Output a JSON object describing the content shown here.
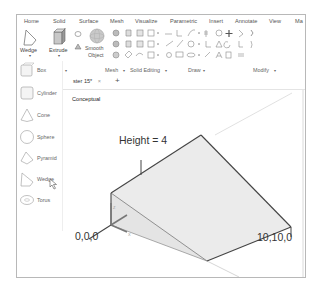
{
  "ribbon": {
    "tabs": [
      "Home",
      "Solid",
      "Surface",
      "Mesh",
      "Visualize",
      "Parametric",
      "Insert",
      "Annotate",
      "View",
      "Ma"
    ],
    "buttons": {
      "wedge": "Wedge",
      "extrude": "Extrude",
      "smooth_object_line1": "Smooth",
      "smooth_object_line2": "Object"
    },
    "panels": {
      "mesh": "Mesh",
      "solid_editing": "Solid Editing",
      "draw": "Draw",
      "modify": "Modify"
    },
    "dropdown_arrow": "▾"
  },
  "flyout": {
    "items": [
      {
        "label": "Box",
        "icon": "box-icon"
      },
      {
        "label": "Cylinder",
        "icon": "cylinder-icon"
      },
      {
        "label": "Cone",
        "icon": "cone-icon"
      },
      {
        "label": "Sphere",
        "icon": "sphere-icon"
      },
      {
        "label": "Pyramid",
        "icon": "pyramid-icon"
      },
      {
        "label": "Wedge",
        "icon": "wedge-icon"
      },
      {
        "label": "Torus",
        "icon": "torus-icon"
      }
    ]
  },
  "viewport": {
    "tab_label": "ster 15*",
    "tab_close": "×",
    "new_tab": "+",
    "visual_style": "Conceptual",
    "annotations": {
      "height": "Height = 4",
      "origin": "0,0,0",
      "corner": "10,10,0"
    }
  }
}
